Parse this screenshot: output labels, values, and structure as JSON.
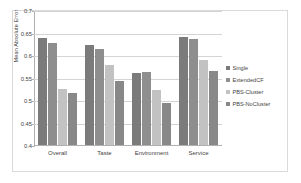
{
  "chart_data": {
    "type": "bar",
    "title": "",
    "xlabel": "",
    "ylabel": "Mean Absolute Error",
    "categories": [
      "Overall",
      "Taste",
      "Environment",
      "Service"
    ],
    "series": [
      {
        "name": "Single",
        "color": "#7b7b7b",
        "values": [
          0.637,
          0.623,
          0.559,
          0.641
        ]
      },
      {
        "name": "ExtendedCF",
        "color": "#8e8e8e",
        "values": [
          0.626,
          0.614,
          0.563,
          0.636
        ]
      },
      {
        "name": "PBS-Cluster",
        "color": "#c2c2c2",
        "values": [
          0.525,
          0.578,
          0.522,
          0.59
        ]
      },
      {
        "name": "PBS-NoCluster",
        "color": "#888888",
        "values": [
          0.515,
          0.542,
          0.493,
          0.564
        ]
      }
    ],
    "ylim": [
      0.4,
      0.7
    ],
    "ytick_values": [
      0.4,
      0.45,
      0.5,
      0.55,
      0.6,
      0.65,
      0.7
    ],
    "ytick_labels": [
      "0.4",
      "0.45",
      "0.5",
      "0.55",
      "0.6",
      "0.65",
      "0.7"
    ],
    "grid": true,
    "legend_position": "right"
  },
  "legend": {
    "entries": [
      {
        "label": "Single"
      },
      {
        "label": "ExtendedCF"
      },
      {
        "label": "PBS-Cluster"
      },
      {
        "label": "PBS-NoCluster"
      }
    ]
  }
}
